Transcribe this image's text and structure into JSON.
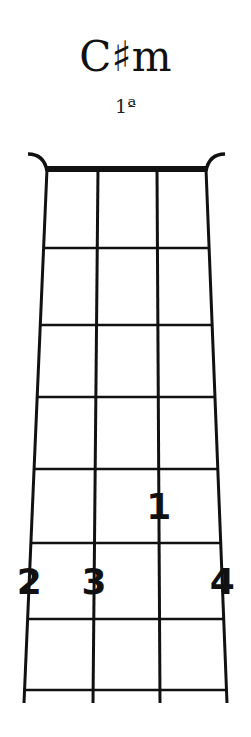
{
  "chord": {
    "name": "C♯m",
    "position_label": "1ª"
  },
  "diagram": {
    "strings": 4,
    "frets_shown": 7,
    "colors": {
      "ink": "#111111",
      "background": "#ffffff"
    },
    "nut": {
      "y": 169,
      "left_x": 47,
      "right_x": 206
    },
    "string_x_top": [
      47,
      98,
      157,
      206
    ],
    "string_x_bottom": [
      24,
      93,
      160,
      227
    ],
    "board_bottom_y": 703,
    "fret_y": [
      248,
      325,
      397,
      469,
      543,
      619,
      690
    ],
    "fingers": [
      {
        "label": "2",
        "string": 1,
        "fret": 6
      },
      {
        "label": "3",
        "string": 2,
        "fret": 6
      },
      {
        "label": "1",
        "string": 3,
        "fret": 5
      },
      {
        "label": "4",
        "string": 4,
        "fret": 6
      }
    ]
  }
}
